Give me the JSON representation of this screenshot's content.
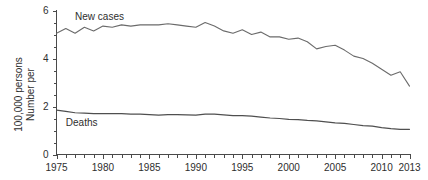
{
  "chart_data": {
    "type": "line",
    "title": "",
    "xlabel": "",
    "ylabel": "Number per 100,000 persons",
    "ylabel_line1": "Number per",
    "ylabel_line2": "100,000 persons",
    "xlim": [
      1975,
      2013
    ],
    "ylim": [
      0,
      6
    ],
    "grid": false,
    "legend_position": "inline-annotation",
    "x_tick_labels": [
      "1975",
      "1980",
      "1985",
      "1990",
      "1995",
      "2000",
      "2005",
      "2010",
      "2013"
    ],
    "x_tick_values": [
      1975,
      1980,
      1985,
      1990,
      1995,
      2000,
      2005,
      2010,
      2013
    ],
    "x_minor_step": 1,
    "y_tick_labels": [
      "0",
      "2",
      "4",
      "6"
    ],
    "y_tick_values": [
      0,
      2,
      4,
      6
    ],
    "y_minor_step": 0.5,
    "x": [
      1975,
      1976,
      1977,
      1978,
      1979,
      1980,
      1981,
      1982,
      1983,
      1984,
      1985,
      1986,
      1987,
      1988,
      1989,
      1990,
      1991,
      1992,
      1993,
      1994,
      1995,
      1996,
      1997,
      1998,
      1999,
      2000,
      2001,
      2002,
      2003,
      2004,
      2005,
      2006,
      2007,
      2008,
      2009,
      2010,
      2011,
      2012,
      2013
    ],
    "series": [
      {
        "name": "New cases",
        "color": "#6b6b6b",
        "label_x": 1977,
        "label_y": 5.75,
        "values": [
          5.05,
          5.25,
          5.05,
          5.3,
          5.15,
          5.35,
          5.3,
          5.4,
          5.35,
          5.4,
          5.4,
          5.4,
          5.45,
          5.4,
          5.35,
          5.3,
          5.5,
          5.35,
          5.15,
          5.05,
          5.2,
          5.0,
          5.1,
          4.9,
          4.9,
          4.8,
          4.85,
          4.7,
          4.4,
          4.5,
          4.55,
          4.35,
          4.1,
          4.0,
          3.8,
          3.55,
          3.3,
          3.45,
          2.85
        ]
      },
      {
        "name": "Deaths",
        "color": "#4f4f4f",
        "label_x": 1976,
        "label_y": 1.35,
        "values": [
          1.85,
          1.8,
          1.74,
          1.72,
          1.7,
          1.7,
          1.7,
          1.7,
          1.68,
          1.68,
          1.66,
          1.64,
          1.66,
          1.66,
          1.65,
          1.64,
          1.68,
          1.68,
          1.65,
          1.62,
          1.62,
          1.6,
          1.56,
          1.52,
          1.5,
          1.46,
          1.45,
          1.42,
          1.4,
          1.36,
          1.32,
          1.3,
          1.25,
          1.2,
          1.18,
          1.12,
          1.08,
          1.05,
          1.05
        ]
      }
    ]
  }
}
